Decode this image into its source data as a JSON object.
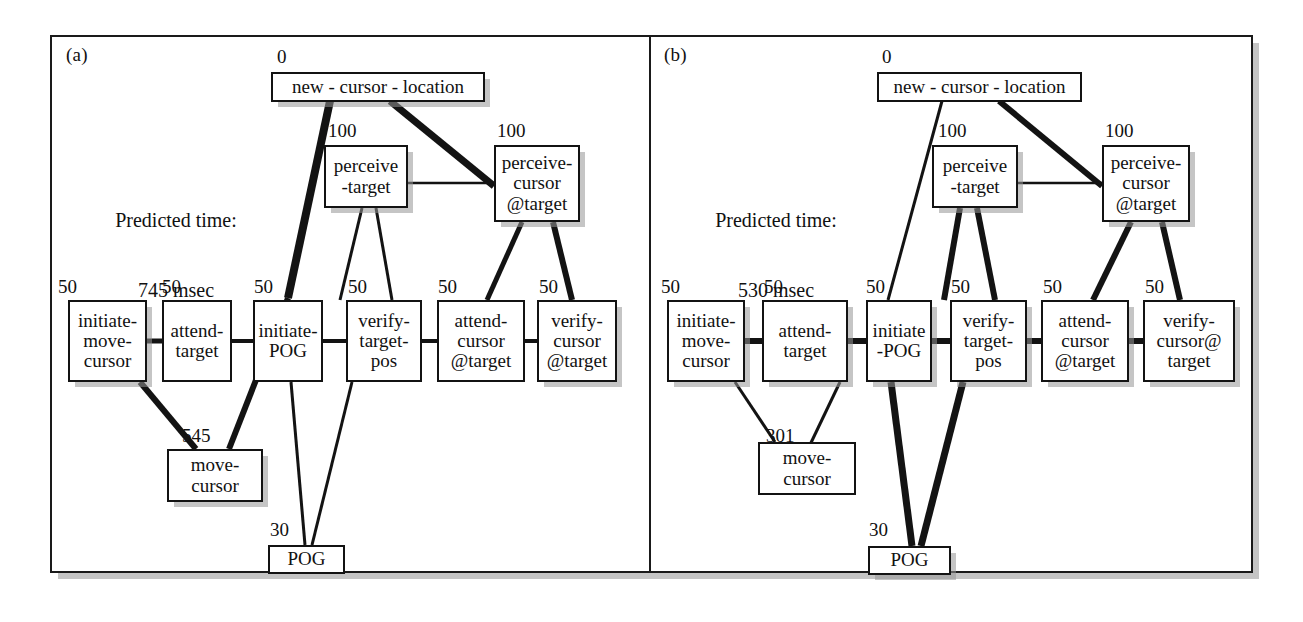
{
  "figure": {
    "caption_a": "(a)",
    "caption_b": "(b)"
  },
  "panel_a": {
    "label": "(a)",
    "predicted_time": "Predicted time:\n745 msec",
    "predicted_time_label": "Predicted time:",
    "predicted_time_value": "745 msec",
    "nodes": [
      {
        "id": "new-cursor-location",
        "text": "new - cursor - location",
        "time": "0"
      },
      {
        "id": "perceive-target",
        "text": "perceive\n-target",
        "time": "100"
      },
      {
        "id": "perceive-cursor-at-target",
        "text": "perceive-\ncursor\n@target",
        "time": "100"
      },
      {
        "id": "initiate-move-cursor",
        "text": "initiate-\nmove-\ncursor",
        "time": "50"
      },
      {
        "id": "attend-target",
        "text": "attend-\ntarget",
        "time": "50"
      },
      {
        "id": "initiate-pog",
        "text": "initiate-\nPOG",
        "time": "50"
      },
      {
        "id": "verify-target-pos",
        "text": "verify-\ntarget-\npos",
        "time": "50"
      },
      {
        "id": "attend-cursor-at-target",
        "text": "attend-\ncursor\n@target",
        "time": "50"
      },
      {
        "id": "verify-cursor-at-target",
        "text": "verify-\ncursor\n@target",
        "time": "50"
      },
      {
        "id": "move-cursor",
        "text": "move-\ncursor",
        "time": "545"
      },
      {
        "id": "pog",
        "text": "POG",
        "time": "30"
      }
    ]
  },
  "panel_b": {
    "label": "(b)",
    "predicted_time": "Predicted time:\n530 msec",
    "predicted_time_label": "Predicted time:",
    "predicted_time_value": "530 msec",
    "nodes": [
      {
        "id": "new-cursor-location",
        "text": "new - cursor - location",
        "time": "0"
      },
      {
        "id": "perceive-target",
        "text": "perceive\n-target",
        "time": "100"
      },
      {
        "id": "perceive-cursor-at-target",
        "text": "perceive-\ncursor\n@target",
        "time": "100"
      },
      {
        "id": "initiate-move-cursor",
        "text": "initiate-\nmove-\ncursor",
        "time": "50"
      },
      {
        "id": "attend-target",
        "text": "attend-\ntarget",
        "time": "50"
      },
      {
        "id": "initiate-pog",
        "text": "initiate\n-POG",
        "time": "50"
      },
      {
        "id": "verify-target-pos",
        "text": "verify-\ntarget-\npos",
        "time": "50"
      },
      {
        "id": "attend-cursor-at-target",
        "text": "attend-\ncursor\n@target",
        "time": "50"
      },
      {
        "id": "verify-cursor-at-target",
        "text": "verify-\ncursor@\ntarget",
        "time": "50"
      },
      {
        "id": "move-cursor",
        "text": "move-\ncursor",
        "time": "301"
      },
      {
        "id": "pog",
        "text": "POG",
        "time": "30"
      }
    ]
  },
  "colors": {
    "stroke": "#131313",
    "shadow": "#969696",
    "background": "#ffffff"
  }
}
